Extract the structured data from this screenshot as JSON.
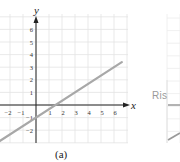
{
  "chart_data": [
    {
      "type": "line",
      "title": "",
      "caption": "(a)",
      "xlabel": "x",
      "ylabel": "y",
      "xlim": [
        -2.9,
        7.2
      ],
      "ylim": [
        -3,
        7
      ],
      "x_ticks": [
        -2,
        -1,
        1,
        2,
        3,
        4,
        5,
        6
      ],
      "y_ticks": [
        -2,
        -1,
        1,
        2,
        3,
        4,
        5,
        6
      ],
      "grid": true,
      "series": [
        {
          "name": "line",
          "equation": "y = (2/3)x - 1",
          "x": [
            -3,
            0,
            1.5,
            3,
            6,
            6.5
          ],
          "y": [
            -3,
            -1,
            0,
            1,
            3,
            3.33
          ],
          "color": "#a8a8a8"
        }
      ]
    },
    {
      "type": "line",
      "partial": true,
      "annotation": "Ris",
      "grid": true
    }
  ],
  "figure": {
    "caption_a": "(a)",
    "axis_x_label": "x",
    "axis_y_label": "y",
    "right_panel_label": "Ris"
  },
  "colors": {
    "grid": "#e3e3e3",
    "axis": "#222222",
    "line": "#a8a8a8",
    "tick_text": "#333333"
  }
}
